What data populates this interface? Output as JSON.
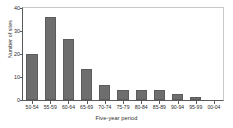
{
  "chart_data": {
    "type": "bar",
    "title": "",
    "xlabel": "Five-year period",
    "ylabel": "Number of sites",
    "categories": [
      "50-54",
      "55-59",
      "60-64",
      "65-69",
      "70-74",
      "75-79",
      "80-84",
      "85-89",
      "90-94",
      "95-99",
      "00-04"
    ],
    "values": [
      20,
      36,
      26.5,
      13.5,
      6.5,
      4.5,
      4.5,
      4.5,
      2.5,
      1.5,
      0
    ],
    "ylim": [
      0,
      40
    ],
    "yticks": [
      0,
      10,
      20,
      30,
      40
    ],
    "ytick_labels": [
      "0",
      "10",
      "20",
      "30",
      "40"
    ],
    "grid": false,
    "legend": null,
    "bar_color": "#6e6e6e",
    "axis_color": "#5a5a5a",
    "text_color": "#2b2b2b",
    "background": "#ffffff"
  }
}
